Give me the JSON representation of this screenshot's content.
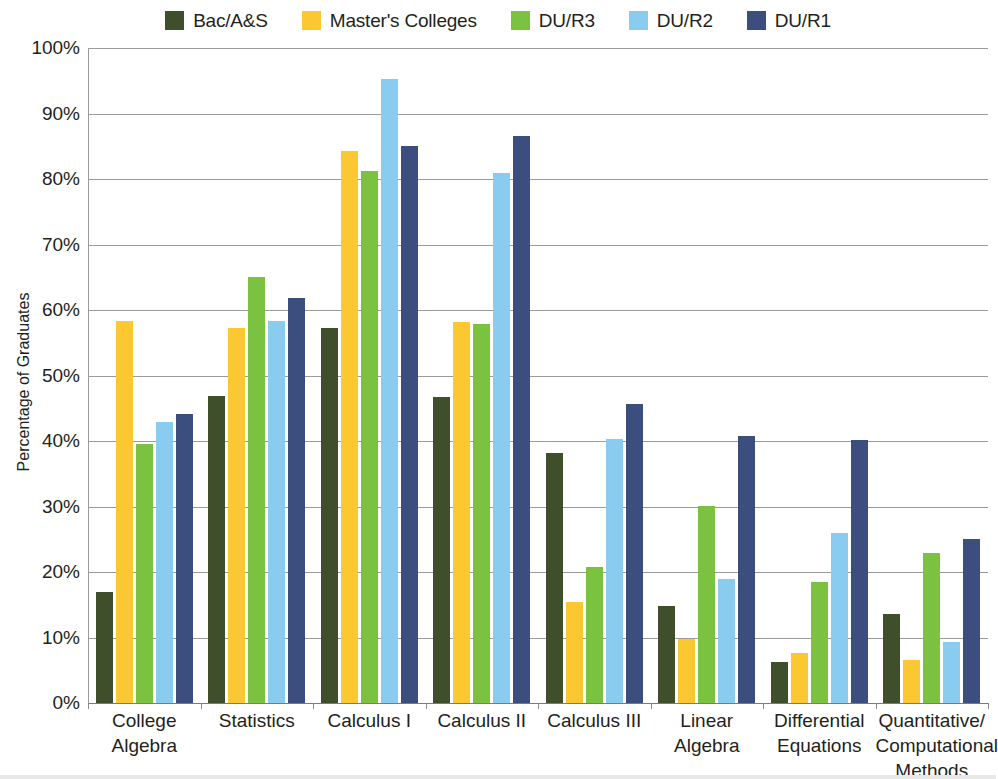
{
  "legend": {
    "items": [
      {
        "label": "Bac/A&S",
        "color": "#3F4F2C",
        "swatch_name": "legend-swatch-bac-as"
      },
      {
        "label": "Master's Colleges",
        "color": "#FBC831",
        "swatch_name": "legend-swatch-masters-colleges"
      },
      {
        "label": "DU/R3",
        "color": "#7CC241",
        "swatch_name": "legend-swatch-du-r3"
      },
      {
        "label": "DU/R2",
        "color": "#89CCF0",
        "swatch_name": "legend-swatch-du-r2"
      },
      {
        "label": "DU/R1",
        "color": "#3B4E7D",
        "swatch_name": "legend-swatch-du-r1"
      }
    ]
  },
  "axes": {
    "y_title": "Percentage of Graduates",
    "y_ticks": [
      "100%",
      "90%",
      "80%",
      "70%",
      "60%",
      "50%",
      "40%",
      "30%",
      "20%",
      "10%",
      "0%"
    ],
    "y_tick_values": [
      100,
      90,
      80,
      70,
      60,
      50,
      40,
      30,
      20,
      10,
      0
    ],
    "x_labels": [
      "College\nAlgebra",
      "Statistics",
      "Calculus I",
      "Calculus II",
      "Calculus III",
      "Linear\nAlgebra",
      "Differential\nEquations",
      "Quantitative/\nComputational\nMethods"
    ]
  },
  "chart_data": {
    "type": "bar",
    "title": "",
    "subtitle": "",
    "xlabel": "",
    "ylabel": "Percentage of Graduates",
    "ylim": [
      0,
      100
    ],
    "ytick_step": 10,
    "grid": true,
    "legend_position": "top-center",
    "units": "percent",
    "categories": [
      "College Algebra",
      "Statistics",
      "Calculus I",
      "Calculus II",
      "Calculus III",
      "Linear Algebra",
      "Differential Equations",
      "Quantitative/Computational Methods"
    ],
    "series": [
      {
        "name": "Bac/A&S",
        "color": "#3F4F2C",
        "values": [
          17.0,
          46.8,
          57.3,
          46.7,
          38.2,
          14.8,
          6.2,
          13.6
        ]
      },
      {
        "name": "Master's Colleges",
        "color": "#FBC831",
        "values": [
          58.3,
          57.3,
          84.3,
          58.2,
          15.4,
          9.8,
          7.6,
          6.6
        ]
      },
      {
        "name": "DU/R3",
        "color": "#7CC241",
        "values": [
          39.6,
          65.0,
          81.2,
          57.9,
          20.8,
          30.1,
          18.4,
          22.9
        ]
      },
      {
        "name": "DU/R2",
        "color": "#89CCF0",
        "values": [
          42.9,
          58.3,
          95.2,
          80.9,
          40.3,
          19.0,
          25.9,
          9.3
        ]
      },
      {
        "name": "DU/R1",
        "color": "#3B4E7D",
        "values": [
          44.2,
          61.9,
          85.0,
          86.6,
          45.7,
          40.7,
          40.1,
          25.1
        ]
      }
    ]
  }
}
